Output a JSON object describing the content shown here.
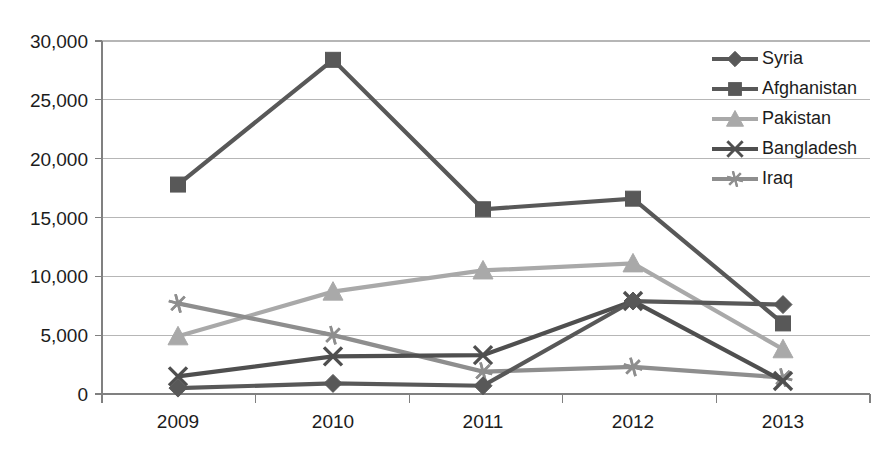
{
  "chart_data": {
    "type": "line",
    "title": "",
    "subtitle": "",
    "xlabel": "",
    "ylabel": "",
    "categories": [
      "2009",
      "2010",
      "2011",
      "2012",
      "2013"
    ],
    "x": [
      2009,
      2010,
      2011,
      2012,
      2013
    ],
    "ylim": [
      0,
      30000
    ],
    "y_ticks": [
      0,
      5000,
      10000,
      15000,
      20000,
      25000,
      30000
    ],
    "y_tick_labels": [
      "0",
      "5,000",
      "10,000",
      "15,000",
      "20,000",
      "25,000",
      "30,000"
    ],
    "grid": true,
    "legend_position": "top-right",
    "series": [
      {
        "name": "Syria",
        "marker": "diamond",
        "color": "#585858",
        "values": [
          500,
          900,
          700,
          7900,
          7600
        ]
      },
      {
        "name": "Afghanistan",
        "marker": "square",
        "color": "#585858",
        "values": [
          17800,
          28400,
          15700,
          16600,
          6000
        ]
      },
      {
        "name": "Pakistan",
        "marker": "triangle",
        "color": "#a9a9a9",
        "values": [
          4900,
          8700,
          10500,
          11100,
          3800
        ]
      },
      {
        "name": "Bangladesh",
        "marker": "x",
        "color": "#4f4f4f",
        "values": [
          1500,
          3200,
          3300,
          7900,
          1100
        ]
      },
      {
        "name": "Iraq",
        "marker": "asterisk",
        "color": "#8e8e8e",
        "values": [
          7700,
          5000,
          1900,
          2300,
          1400
        ]
      }
    ]
  },
  "legend": {
    "items": [
      {
        "label": "Syria"
      },
      {
        "label": "Afghanistan"
      },
      {
        "label": "Pakistan"
      },
      {
        "label": "Bangladesh"
      },
      {
        "label": "Iraq"
      }
    ]
  },
  "axes": {
    "y_tick_labels": [
      "30,000",
      "25,000",
      "20,000",
      "15,000",
      "10,000",
      "5,000",
      "0"
    ],
    "x_tick_labels": [
      "2009",
      "2010",
      "2011",
      "2012",
      "2013"
    ]
  },
  "colors": {
    "gridline": "#b6b6b6",
    "axis": "#808080",
    "text": "#1c1c1c",
    "dark_series": "#585858",
    "mid_series": "#8e8e8e",
    "light_series": "#a9a9a9",
    "background": "#ffffff"
  }
}
